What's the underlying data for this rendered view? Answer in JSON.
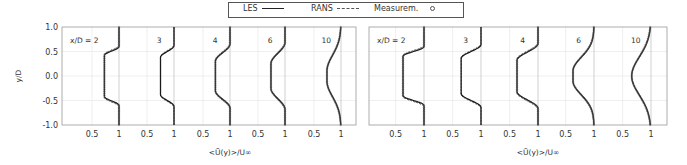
{
  "legend": {
    "entries": [
      {
        "label": "LES",
        "style": "solid"
      },
      {
        "label": "RANS",
        "style": "dashed"
      },
      {
        "label": "Measurem.",
        "style": "marker"
      }
    ]
  },
  "chart_data": [
    {
      "type": "line",
      "title": "",
      "xlabel": "<Ũ(y)>/U∞",
      "ylabel": "y/D",
      "ylim": [
        -1.0,
        1.0
      ],
      "yticks": [
        "1.0",
        "0.5",
        "0.0",
        "-0.5",
        "-1.0"
      ],
      "grid": true,
      "panels": [
        {
          "label": "x/D = 2",
          "xticks": [
            "0.5",
            "1"
          ],
          "min_velocity": 0.73,
          "core_halfwidth": 0.42,
          "shear_halfwidth": 0.6,
          "shape": "top-hat"
        },
        {
          "label": "3",
          "xticks": [
            "0.5",
            "1"
          ],
          "min_velocity": 0.75,
          "core_halfwidth": 0.38,
          "shear_halfwidth": 0.62,
          "shape": "top-hat"
        },
        {
          "label": "4",
          "xticks": [
            "0.5",
            "1"
          ],
          "min_velocity": 0.73,
          "core_halfwidth": 0.3,
          "shear_halfwidth": 0.65,
          "shape": "top-hat"
        },
        {
          "label": "6",
          "xticks": [
            "0.5",
            "1"
          ],
          "min_velocity": 0.74,
          "core_halfwidth": 0.25,
          "shear_halfwidth": 0.68,
          "shape": "top-hat"
        },
        {
          "label": "10",
          "xticks": [
            "0.5",
            "1"
          ],
          "min_velocity": 0.74,
          "core_halfwidth": 0.1,
          "shear_halfwidth": 0.8,
          "shape": "gaussian"
        }
      ],
      "series": [
        "LES",
        "RANS",
        "Measurem."
      ]
    },
    {
      "type": "line",
      "title": "",
      "xlabel": "<Ũ(y)>/U∞",
      "ylabel": "",
      "ylim": [
        -1.0,
        1.0
      ],
      "grid": true,
      "panels": [
        {
          "label": "x/D = 2",
          "xticks": [
            "0.5",
            "1"
          ],
          "min_velocity": 0.63,
          "core_halfwidth": 0.4,
          "shear_halfwidth": 0.6,
          "shape": "top-hat"
        },
        {
          "label": "3",
          "xticks": [
            "0.5",
            "1"
          ],
          "min_velocity": 0.65,
          "core_halfwidth": 0.36,
          "shear_halfwidth": 0.64,
          "shape": "top-hat"
        },
        {
          "label": "4",
          "xticks": [
            "0.5",
            "1"
          ],
          "min_velocity": 0.63,
          "core_halfwidth": 0.32,
          "shear_halfwidth": 0.66,
          "shape": "top-hat"
        },
        {
          "label": "6",
          "xticks": [
            "0.5",
            "1"
          ],
          "min_velocity": 0.63,
          "core_halfwidth": 0.1,
          "shear_halfwidth": 0.72,
          "shape": "rounded"
        },
        {
          "label": "10",
          "xticks": [
            "0.5",
            "1"
          ],
          "min_velocity": 0.66,
          "core_halfwidth": 0.0,
          "shear_halfwidth": 0.85,
          "shape": "gaussian"
        }
      ],
      "series": [
        "LES",
        "RANS",
        "Measurem."
      ]
    }
  ]
}
